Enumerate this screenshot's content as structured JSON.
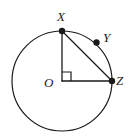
{
  "figure": {
    "type": "circle-geometry-diagram",
    "background_color": "#ffffff",
    "stroke_color": "#1a1a1a",
    "labels": {
      "center": "O",
      "top_point": "X",
      "arc_point": "Y",
      "right_point": "Z"
    },
    "circle": {
      "center_x": 62,
      "center_y": 81,
      "radius": 50,
      "stroke_width": 1.2
    },
    "points": [
      {
        "name": "X",
        "x": 62,
        "y": 31,
        "dot_radius": 3.2,
        "filled": true
      },
      {
        "name": "Y",
        "x": 96.5,
        "y": 42.5,
        "dot_radius": 3.2,
        "filled": true
      },
      {
        "name": "Z",
        "x": 112,
        "y": 81,
        "dot_radius": 3.2,
        "filled": true
      }
    ],
    "segments": [
      {
        "name": "radius-OX",
        "x1": 62,
        "y1": 81,
        "x2": 62,
        "y2": 31
      },
      {
        "name": "radius-OZ",
        "x1": 62,
        "y1": 81,
        "x2": 112,
        "y2": 81
      },
      {
        "name": "chord-XZ",
        "x1": 62,
        "y1": 31,
        "x2": 112,
        "y2": 81
      }
    ],
    "right_angle_mark": {
      "at": "O",
      "size": 9,
      "path": "M 62 72 L 71 72 L 71 81"
    }
  }
}
